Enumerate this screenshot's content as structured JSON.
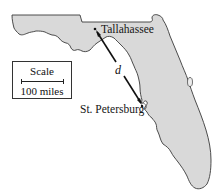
{
  "map": {
    "region": "Florida",
    "land_color": "#d9d9d9",
    "outline_color": "#3a3a3a",
    "cities": [
      {
        "name": "Tallahassee",
        "x": 95,
        "y": 29
      },
      {
        "name": "St. Petersburg",
        "x": 142,
        "y": 106
      }
    ],
    "distance_line": {
      "label": "d",
      "from": "Tallahassee",
      "to": "St. Petersburg"
    },
    "scale": {
      "title": "Scale",
      "value": "100 miles"
    }
  }
}
